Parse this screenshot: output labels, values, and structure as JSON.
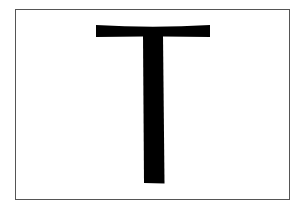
{
  "image": {
    "description": "Large black letter T centered inside a thin gray rectangular border on a white background",
    "letter": "T",
    "colors": {
      "background": "#ffffff",
      "border": "#555555",
      "glyph": "#000000"
    }
  }
}
